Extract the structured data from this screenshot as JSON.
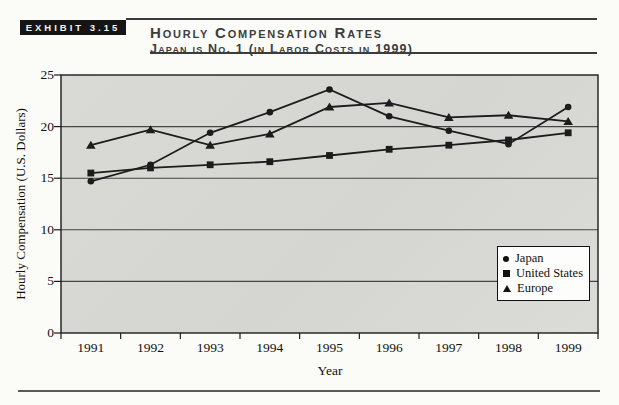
{
  "header": {
    "exhibit_label": "EXHIBIT 3.15",
    "title": "Hourly Compensation Rates",
    "subtitle": "Japan is No. 1 (in Labor Costs in 1999)"
  },
  "chart_data": {
    "type": "line",
    "title": "Hourly Compensation Rates",
    "subtitle": "Japan is No. 1 (in Labor Costs in 1999)",
    "xlabel": "Year",
    "ylabel": "Hourly Compensation (U.S. Dollars)",
    "categories": [
      "1991",
      "1992",
      "1993",
      "1994",
      "1995",
      "1996",
      "1997",
      "1998",
      "1999"
    ],
    "ylim": [
      0,
      25
    ],
    "yticks": [
      0,
      5,
      10,
      15,
      20,
      25
    ],
    "grid": "horizontal",
    "legend_position": "inside-right",
    "line_color": "#1c1c1c",
    "plot_bg_color": "#d6d6d2",
    "series": [
      {
        "name": "Japan",
        "marker": "circle",
        "values": [
          14.7,
          16.3,
          19.4,
          21.4,
          23.6,
          21.0,
          19.6,
          18.3,
          21.9
        ]
      },
      {
        "name": "United States",
        "marker": "square",
        "values": [
          15.5,
          16.0,
          16.3,
          16.6,
          17.2,
          17.8,
          18.2,
          18.7,
          19.4
        ]
      },
      {
        "name": "Europe",
        "marker": "triangle",
        "values": [
          18.2,
          19.7,
          18.2,
          19.3,
          21.9,
          22.3,
          20.9,
          21.1,
          20.5
        ]
      }
    ]
  }
}
